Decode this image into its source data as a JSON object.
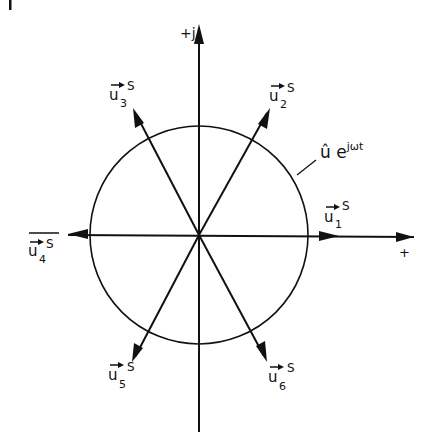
{
  "figure_marker": "I",
  "axes": {
    "imag_label": "+j",
    "real_label": "+"
  },
  "circle_label": {
    "base": "û e",
    "exponent": "jωt"
  },
  "vectors": [
    {
      "name": "u",
      "index": "1",
      "superscript": "S",
      "angle_deg": 0
    },
    {
      "name": "u",
      "index": "2",
      "superscript": "S",
      "angle_deg": 60
    },
    {
      "name": "u",
      "index": "3",
      "superscript": "S",
      "angle_deg": 120
    },
    {
      "name": "u",
      "index": "4",
      "superscript": "S",
      "angle_deg": 180,
      "overbar": true
    },
    {
      "name": "u",
      "index": "5",
      "superscript": "S",
      "angle_deg": 240
    },
    {
      "name": "u",
      "index": "6",
      "superscript": "S",
      "angle_deg": 300
    }
  ],
  "colors": {
    "ink": "#111111",
    "background": "#ffffff"
  }
}
